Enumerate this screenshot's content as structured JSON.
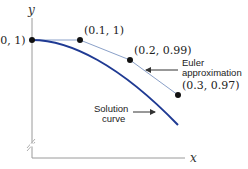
{
  "diagram": {
    "axes": {
      "x_label": "x",
      "y_label": "y",
      "axis_color": "#9a9a9a",
      "has_axis_break": true
    },
    "points": [
      {
        "label": "(0, 1)",
        "x": 0,
        "y": 1
      },
      {
        "label": "(0.1, 1)",
        "x": 0.1,
        "y": 1
      },
      {
        "label": "(0.2, 0.99)",
        "x": 0.2,
        "y": 0.99
      },
      {
        "label": "(0.3, 0.97)",
        "x": 0.3,
        "y": 0.97
      }
    ],
    "annotations": {
      "euler_line1": "Euler",
      "euler_line2": "approximation",
      "solution_line1": "Solution",
      "solution_line2": "curve"
    },
    "colors": {
      "solution_curve": "#1f3a93",
      "euler_polyline": "#8aa0c8",
      "points": "#111111",
      "arrows": "#333333"
    }
  }
}
